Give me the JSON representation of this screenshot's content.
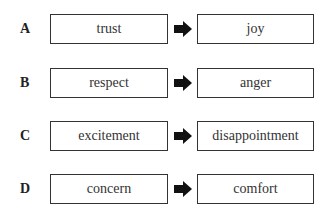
{
  "rows": [
    {
      "letter": "A",
      "from": "trust",
      "to": "joy"
    },
    {
      "letter": "B",
      "from": "respect",
      "to": "anger"
    },
    {
      "letter": "C",
      "from": "excitement",
      "to": "disappointment"
    },
    {
      "letter": "D",
      "from": "concern",
      "to": "comfort"
    }
  ],
  "icons": {
    "arrow": "right-arrow-icon"
  },
  "colors": {
    "border": "#333333",
    "arrow": "#111111",
    "background": "#ffffff"
  }
}
